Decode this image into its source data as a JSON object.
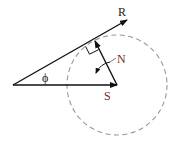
{
  "diagram": {
    "labels": {
      "R": "R",
      "N": "N",
      "S": "S",
      "phi": "ϕ"
    },
    "colors": {
      "line": "#111111",
      "circle": "#999999",
      "label_dark": "#222222",
      "label_accent": "#7a2a2a"
    },
    "elements": [
      {
        "name": "vector-R",
        "from": [
          13,
          85
        ],
        "to": [
          127,
          20
        ]
      },
      {
        "name": "vector-S",
        "from": [
          13,
          85
        ],
        "to": [
          117,
          85
        ]
      },
      {
        "name": "vector-N",
        "from": [
          117,
          85
        ],
        "to": [
          95,
          41
        ]
      },
      {
        "name": "dashed-circle",
        "center": [
          117,
          85
        ],
        "radius": 50
      },
      {
        "name": "right-angle-marker",
        "at": [
          95,
          41
        ]
      },
      {
        "name": "rotation-arrow",
        "near": [
          100,
          65
        ]
      }
    ]
  }
}
